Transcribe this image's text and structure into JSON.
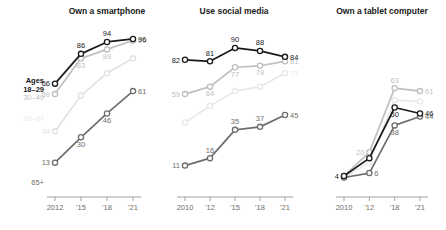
{
  "chart_data": {
    "type": "line",
    "title": "",
    "panels": [
      {
        "title": "Own a smartphone",
        "x": [
          "2012",
          "'15",
          "'18",
          "'21"
        ],
        "xtick_labels": [
          "2012",
          "'15",
          "'18",
          "'21"
        ],
        "ylim": [
          0,
          100
        ],
        "series": [
          {
            "name": "Ages 18-29",
            "color": "#1a1a1a",
            "values": [
              66,
              86,
              94,
              96
            ],
            "labels": [
              "66",
              "86",
              "94",
              "96"
            ],
            "label_pos": [
              "left",
              "above",
              "above",
              "right"
            ]
          },
          {
            "name": "30-49",
            "color": "#bfbfbf",
            "values": [
              59,
              83,
              89,
              95
            ],
            "labels": [
              "59",
              "83",
              "89",
              "95"
            ],
            "label_pos": [
              "left",
              "below",
              "below",
              "right"
            ]
          },
          {
            "name": "50-64",
            "color": "#e2e2e2",
            "values": [
              34,
              58,
              73,
              83
            ],
            "labels": [
              "34",
              "",
              "",
              ""
            ],
            "label_pos": [
              "left",
              "below",
              "below",
              "right"
            ]
          },
          {
            "name": "65+",
            "color": "#6e6e6e",
            "values": [
              13,
              30,
              46,
              61
            ],
            "labels": [
              "13",
              "30",
              "46",
              "61"
            ],
            "label_pos": [
              "left",
              "below",
              "below",
              "right"
            ]
          }
        ]
      },
      {
        "title": "Use social media",
        "x": [
          "2010",
          "'12",
          "'15",
          "'18",
          "'21"
        ],
        "xtick_labels": [
          "2010",
          "'12",
          "'15",
          "'18",
          "'21"
        ],
        "ylim": [
          0,
          100
        ],
        "series": [
          {
            "name": "Ages 18-29",
            "color": "#1a1a1a",
            "values": [
              82,
              81,
              90,
              88,
              84
            ],
            "labels": [
              "82",
              "81",
              "90",
              "88",
              "84"
            ],
            "label_pos": [
              "left",
              "above",
              "above",
              "above",
              "right"
            ]
          },
          {
            "name": "30-49",
            "color": "#bfbfbf",
            "values": [
              59,
              64,
              77,
              78,
              81
            ],
            "labels": [
              "59",
              "64",
              "77",
              "78",
              "81"
            ],
            "label_pos": [
              "left",
              "below",
              "below",
              "below",
              "right"
            ]
          },
          {
            "name": "50-64",
            "color": "#e8e8e8",
            "values": [
              40,
              51,
              61,
              64,
              73
            ],
            "labels": [
              "",
              "",
              "",
              "",
              "73"
            ],
            "label_pos": [
              "left",
              "below",
              "below",
              "below",
              "right"
            ]
          },
          {
            "name": "65+",
            "color": "#6e6e6e",
            "values": [
              11,
              16,
              35,
              37,
              45
            ],
            "labels": [
              "11",
              "16",
              "35",
              "37",
              "45"
            ],
            "label_pos": [
              "left",
              "above",
              "above",
              "above",
              "right"
            ]
          }
        ]
      },
      {
        "title": "Own a tablet computer",
        "x": [
          "2010",
          "'12",
          "'18",
          "'21"
        ],
        "xtick_labels": [
          "2010",
          "'12",
          "'18",
          "'21"
        ],
        "ylim": [
          0,
          100
        ],
        "series": [
          {
            "name": "30-49",
            "color": "#bfbfbf",
            "values": [
              4,
              20,
              63,
              61
            ],
            "labels": [
              "",
              "20",
              "63",
              "61"
            ],
            "label_pos": [
              "left",
              "left",
              "above",
              "right"
            ]
          },
          {
            "name": "Ages 18-29",
            "color": "#1a1a1a",
            "values": [
              4,
              16,
              50,
              46
            ],
            "labels": [
              "4",
              "",
              "50",
              "46"
            ],
            "label_pos": [
              "left",
              "below",
              "below",
              "right"
            ]
          },
          {
            "name": "50-64",
            "color": "#e8e8e8",
            "values": [
              3,
              13,
              55,
              54
            ],
            "labels": [
              "",
              "",
              "",
              ""
            ],
            "label_pos": [
              "left",
              "below",
              "below",
              "right"
            ]
          },
          {
            "name": "65+",
            "color": "#6e6e6e",
            "values": [
              3,
              6,
              38,
              44
            ],
            "labels": [
              "",
              "6",
              "38",
              "44"
            ],
            "label_pos": [
              "left",
              "right",
              "below",
              "right"
            ]
          }
        ]
      }
    ],
    "group_labels": [
      {
        "name": "ages-18-29",
        "lines": [
          "Ages",
          "18–29"
        ],
        "value": "66",
        "color": "#1a1a1a"
      },
      {
        "name": "30-49",
        "lines": [
          "30–49"
        ],
        "value": "59",
        "color": "#bfbfbf"
      },
      {
        "name": "50-64",
        "lines": [
          "50–64"
        ],
        "value": "34",
        "color": "#ececec"
      },
      {
        "name": "65-plus",
        "lines": [
          "65+"
        ],
        "value": "13",
        "color": "#6e6e6e"
      }
    ]
  }
}
